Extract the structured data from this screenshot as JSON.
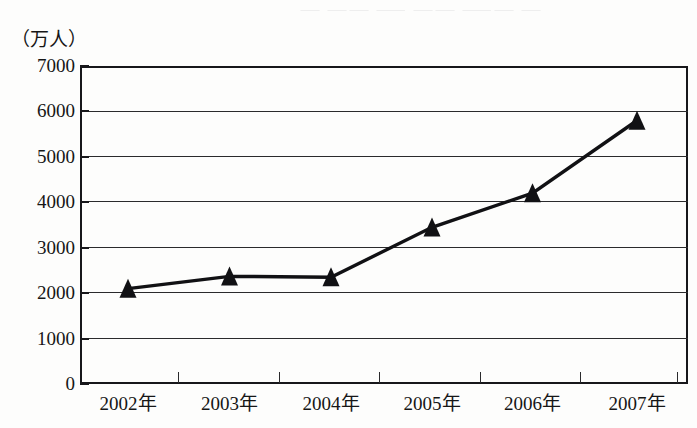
{
  "chart_data": {
    "type": "line",
    "title": "",
    "subtitle": "",
    "xlabel": "",
    "ylabel": "（万人）",
    "unit_caption": "（万人）",
    "categories": [
      "2002年",
      "2003年",
      "2004年",
      "2005年",
      "2006年",
      "2007年"
    ],
    "values": [
      2100,
      2370,
      2350,
      3450,
      4200,
      5800
    ],
    "series": [
      {
        "name": "",
        "values": [
          2100,
          2370,
          2350,
          3450,
          4200,
          5800
        ]
      }
    ],
    "ylim": [
      0,
      7000
    ],
    "yticks": [
      0,
      1000,
      2000,
      3000,
      4000,
      5000,
      6000,
      7000
    ],
    "ytick_labels": [
      "0",
      "1000",
      "2000",
      "3000",
      "4000",
      "5000",
      "6000",
      "7000"
    ],
    "grid": true,
    "grid_axis": "y",
    "legend": false,
    "legend_position": "none",
    "marker": "triangle-up",
    "marker_color": "#111114",
    "line_color": "#111114",
    "background_color": "#fdfdfc",
    "axis_color": "#17171a",
    "grid_color": "#2a2a2c"
  },
  "artifacts": {
    "top_bleed_text": "⸺ ⸺⸺ ⸻ ⸺⸺ ⸻⸺ ⸺"
  }
}
